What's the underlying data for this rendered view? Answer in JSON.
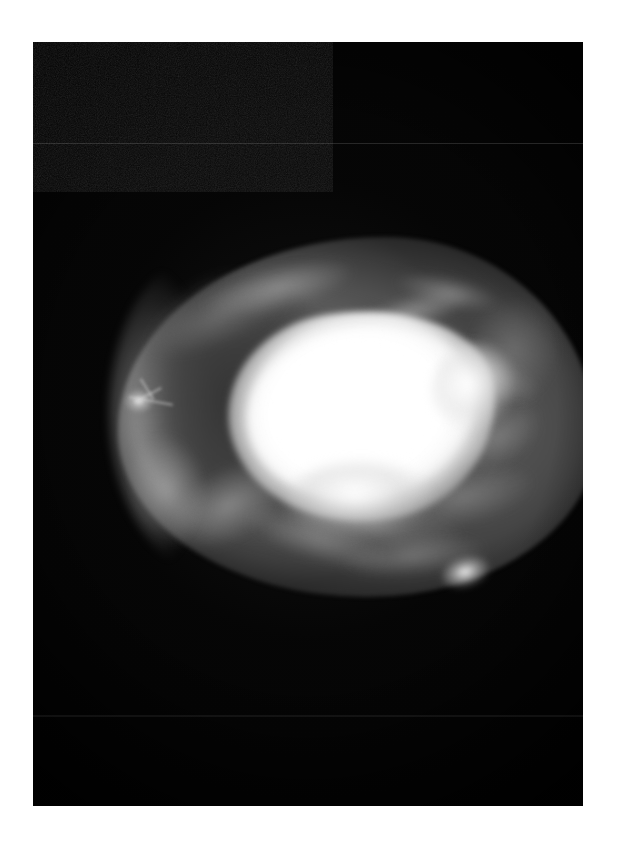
{
  "image": {
    "kind": "medical-radiograph",
    "modality": "mammogram",
    "view": "mediolateral-oblique",
    "orientation": "horizontal",
    "frame": {
      "left_px": 33,
      "top_px": 42,
      "width_px": 550,
      "height_px": 764,
      "background_color": "#050505",
      "page_background_color": "#ffffff"
    },
    "artifacts": {
      "scanlines": [
        {
          "y_px": 101,
          "intensity": "faint"
        },
        {
          "y_px": 673,
          "intensity": "faint"
        }
      ],
      "grain": "visible film grain / digitization speckle"
    }
  },
  "anatomy": {
    "silhouette": {
      "label": "breast soft-tissue silhouette",
      "bounds_px": {
        "x": 85,
        "y": 195,
        "w": 478,
        "h": 360
      },
      "tone": "mid-grey"
    },
    "regions": [
      {
        "name": "fatty-lobe",
        "label": "radiolucent fatty region",
        "tone": "dark grey",
        "position": "left / upper-left quadrant"
      },
      {
        "name": "dense-mass",
        "label": "dense high-attenuation mass",
        "tone": "bright white",
        "position": "central, extending upper-left to right",
        "bounds_px": {
          "x": 196,
          "y": 268,
          "w": 268,
          "h": 212
        }
      },
      {
        "name": "fibroglandular-tissue",
        "label": "fibroglandular strands",
        "tone": "light grey",
        "position": "right half and inferior margin"
      },
      {
        "name": "skin-line",
        "label": "bright skin-line rim",
        "tone": "light grey",
        "position": "left and inferior border"
      }
    ],
    "foci": [
      {
        "name": "stellate-focus-left",
        "label": "small stellate bright focus",
        "center_px": {
          "x": 106,
          "y": 359
        }
      },
      {
        "name": "bright-focus-lower-right",
        "label": "bright nodular focus",
        "center_px": {
          "x": 437,
          "y": 530
        }
      }
    ]
  },
  "palette": {
    "film_black": "#050505",
    "tissue_mid": "#6c6c6c",
    "tissue_dark": "#2e2e2e",
    "mass_white": "#ffffff",
    "page_white": "#ffffff"
  }
}
